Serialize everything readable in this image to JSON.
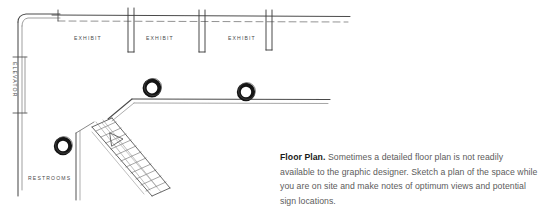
{
  "figure": {
    "kind": "hand-drawn architectural floor plan sketch",
    "labels": {
      "elevator": "ELEVATOR",
      "restrooms": "RESTROOMS",
      "exhibit_1": "EXHIBIT",
      "exhibit_2": "EXHIBIT",
      "exhibit_3": "EXHIBIT"
    },
    "colors": {
      "ink": "#3a3a3a",
      "ink_light": "#6b6b6b",
      "column_fill": "#1a1a1a",
      "paper": "#ffffff"
    }
  },
  "caption": {
    "lead": "Floor Plan.",
    "body": " Sometimes a detailed floor plan is not readily available to the graphic designer. Sketch a plan of the space while you are on site and make notes of optimum views and potential sign locations."
  }
}
